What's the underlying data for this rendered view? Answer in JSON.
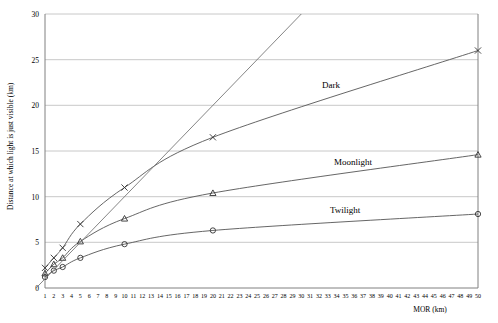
{
  "chart_data": {
    "type": "line",
    "title": "",
    "xlabel": "MOR (km)",
    "ylabel": "Distance at which light is just visible (km)",
    "xlim": [
      0,
      50
    ],
    "ylim": [
      0,
      30
    ],
    "grid": true,
    "legend": "inline-annotations",
    "xticks": [
      1,
      2,
      3,
      4,
      5,
      6,
      7,
      8,
      9,
      10,
      11,
      12,
      13,
      14,
      15,
      16,
      17,
      18,
      19,
      20,
      21,
      22,
      23,
      24,
      25,
      26,
      27,
      28,
      29,
      30,
      31,
      32,
      33,
      34,
      35,
      36,
      37,
      38,
      39,
      40,
      41,
      42,
      43,
      44,
      45,
      46,
      47,
      48,
      49,
      50
    ],
    "yticks": [
      0,
      5,
      10,
      15,
      20,
      25,
      30
    ],
    "series": [
      {
        "name": "Dark",
        "marker": "x",
        "x": [
          1,
          2,
          3,
          5,
          10,
          20,
          50
        ],
        "values": [
          2.2,
          3.3,
          4.4,
          7.0,
          11.0,
          16.5,
          26.0
        ]
      },
      {
        "name": "Moonlight",
        "marker": "triangle",
        "x": [
          1,
          2,
          3,
          5,
          10,
          20,
          50
        ],
        "values": [
          1.6,
          2.6,
          3.3,
          5.1,
          7.6,
          10.4,
          14.6
        ]
      },
      {
        "name": "Twilight",
        "marker": "circle",
        "x": [
          1,
          2,
          3,
          5,
          10,
          20,
          50
        ],
        "values": [
          1.2,
          1.9,
          2.3,
          3.3,
          4.8,
          6.3,
          8.1
        ]
      },
      {
        "name": "reference-line",
        "marker": "none",
        "x": [
          0,
          30
        ],
        "values": [
          0,
          30
        ]
      }
    ],
    "annotations": [
      {
        "text": "Dark",
        "x": 28,
        "y": 21.8
      },
      {
        "text": "Moonlight",
        "x": 33,
        "y": 13.0
      },
      {
        "text": "Twilight",
        "x": 31,
        "y": 8.5
      }
    ]
  },
  "axis": {
    "y_title": "Distance at which light is just visible (km)",
    "x_title": "MOR (km)",
    "y_tick_0": "0",
    "y_tick_5": "5",
    "y_tick_10": "10",
    "y_tick_15": "15",
    "y_tick_20": "20",
    "y_tick_25": "25",
    "y_tick_30": "30"
  },
  "labels": {
    "dark": "Dark",
    "moonlight": "Moonlight",
    "twilight": "Twilight"
  }
}
